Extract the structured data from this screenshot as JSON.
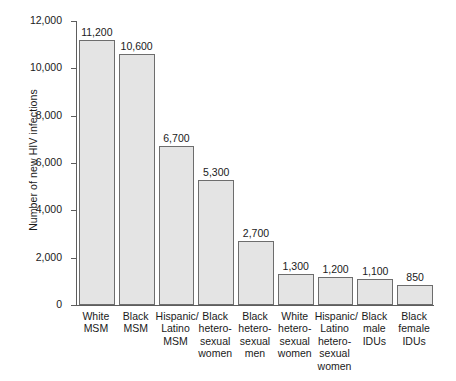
{
  "chart_data": {
    "type": "bar",
    "title": "",
    "xlabel": "",
    "ylabel": "Number of new HIV infections",
    "ylim": [
      0,
      12000
    ],
    "ytick_labels": [
      "12,000",
      "10,000",
      "8,000",
      "6,000",
      "4,000",
      "2,000",
      "0"
    ],
    "ytick_values": [
      12000,
      10000,
      8000,
      6000,
      4000,
      2000,
      0
    ],
    "grid": false,
    "legend": "none",
    "categories": [
      "White MSM",
      "Black MSM",
      "Hispanic/ Latino MSM",
      "Black hetero-sexual women",
      "Black hetero-sexual men",
      "White hetero-sexual women",
      "Hispanic/ Latino hetero-sexual women",
      "Black male IDUs",
      "Black female IDUs"
    ],
    "category_lines": [
      [
        "White",
        "MSM"
      ],
      [
        "Black",
        "MSM"
      ],
      [
        "Hispanic/",
        "Latino",
        "MSM"
      ],
      [
        "Black",
        "hetero-",
        "sexual",
        "women"
      ],
      [
        "Black",
        "hetero-",
        "sexual",
        "men"
      ],
      [
        "White",
        "hetero-",
        "sexual",
        "women"
      ],
      [
        "Hispanic/",
        "Latino",
        "hetero-",
        "sexual",
        "women"
      ],
      [
        "Black",
        "male",
        "IDUs"
      ],
      [
        "Black",
        "female",
        "IDUs"
      ]
    ],
    "values": [
      11200,
      10600,
      6700,
      5300,
      2700,
      1300,
      1200,
      1100,
      850
    ],
    "value_labels": [
      "11,200",
      "10,600",
      "6,700",
      "5,300",
      "2,700",
      "1,300",
      "1,200",
      "1,100",
      "850"
    ],
    "colors": {
      "bar_fill": "#e4e4e4",
      "bar_stroke": "#6d6d6d",
      "axis": "#5d5d5d",
      "text": "#1a1a1a",
      "background": "#ffffff"
    }
  }
}
